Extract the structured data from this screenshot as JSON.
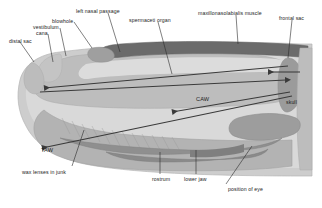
{
  "diagram": {
    "background_color": "#ffffff",
    "label_color": "#1c1c1c",
    "palette": {
      "body_outline": "#c9c9c9",
      "blubber": "#cfcfcf",
      "spermaceti_organ": "#b8b8b8",
      "muscle_dark": "#6e6e6e",
      "junk_lenses": "#a8a8a8",
      "skull_bone": "#9a9a9a",
      "lower_jaw": "#8f8f8f",
      "frontal_sac_band": "#7a7a7a",
      "arrow_color": "#3a3a3a",
      "leader_line": "#2b2b2b"
    },
    "labels": [
      {
        "id": "distal-sac",
        "text": "distal sac",
        "x": 9,
        "y": 39
      },
      {
        "id": "cana",
        "text": "cana",
        "x": 36,
        "y": 31
      },
      {
        "id": "vestibulum",
        "text": "vestibulum",
        "x": 33,
        "y": 25
      },
      {
        "id": "blowhole",
        "text": "blowhole",
        "x": 52,
        "y": 19
      },
      {
        "id": "left-nasal-passage",
        "text": "left nasal passage",
        "x": 76,
        "y": 9
      },
      {
        "id": "spermaceti-organ",
        "text": "spermaceti organ",
        "x": 129,
        "y": 18
      },
      {
        "id": "maxillonasolabialis",
        "text": "maxillonasolabialis muscle",
        "x": 198,
        "y": 11
      },
      {
        "id": "frontal-sac",
        "text": "frontal sac",
        "x": 279,
        "y": 16
      },
      {
        "id": "caw",
        "text": "CAW",
        "x": 196,
        "y": 97
      },
      {
        "id": "taw",
        "text": "TAW",
        "x": 41,
        "y": 148
      },
      {
        "id": "wax-lenses-in-junk",
        "text": "wax lenses in junk",
        "x": 22,
        "y": 170
      },
      {
        "id": "skull",
        "text": "skull",
        "x": 286,
        "y": 100
      },
      {
        "id": "rostrum",
        "text": "rostrum",
        "x": 152,
        "y": 177
      },
      {
        "id": "lower-jaw",
        "text": "lower jaw",
        "x": 184,
        "y": 177
      },
      {
        "id": "position-of-eye",
        "text": "position of eye",
        "x": 228,
        "y": 187
      }
    ]
  }
}
